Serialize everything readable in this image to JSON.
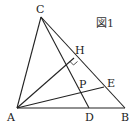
{
  "figure": {
    "caption": "図1",
    "points": {
      "A": {
        "label": "A",
        "x": 17,
        "y": 108
      },
      "B": {
        "label": "B",
        "x": 125,
        "y": 108
      },
      "C": {
        "label": "C",
        "x": 41,
        "y": 17
      },
      "D": {
        "label": "D",
        "x": 89,
        "y": 108
      },
      "E": {
        "label": "E",
        "x": 104,
        "y": 87
      },
      "H": {
        "label": "H",
        "x": 74,
        "y": 58
      },
      "P": {
        "label": "P",
        "x": 80,
        "y": 93
      }
    },
    "segments": [
      "AB",
      "BC",
      "CA",
      "CD",
      "AH",
      "AE"
    ],
    "annotations": [
      "right-angle at H"
    ]
  }
}
